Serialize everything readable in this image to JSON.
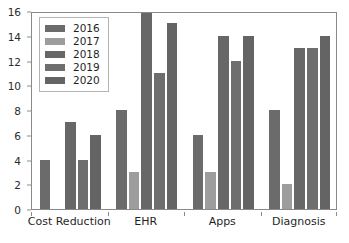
{
  "chart_data": {
    "type": "bar",
    "title": "",
    "subtitle": "",
    "xlabel": "",
    "ylabel": "",
    "categories": [
      "Cost Reduction",
      "EHR",
      "Apps",
      "Diagnosis"
    ],
    "series": [
      {
        "name": "2016",
        "color": "#6b6b6b",
        "values": [
          4,
          8,
          6,
          8
        ]
      },
      {
        "name": "2017",
        "color": "#9d9d9d",
        "values": [
          0,
          3,
          3,
          2
        ]
      },
      {
        "name": "2018",
        "color": "#676767",
        "values": [
          7,
          16,
          14,
          13
        ]
      },
      {
        "name": "2019",
        "color": "#6e6e6e",
        "values": [
          4,
          11,
          12,
          13
        ]
      },
      {
        "name": "2020",
        "color": "#646464",
        "values": [
          6,
          15,
          14,
          14
        ]
      }
    ],
    "ylim": [
      0,
      16
    ],
    "yticks": [
      0,
      2,
      4,
      6,
      8,
      10,
      12,
      14,
      16
    ],
    "ytick_labels": [
      "0",
      "2",
      "4",
      "6",
      "8",
      "10",
      "12",
      "14",
      "16"
    ],
    "grid": false,
    "legend_position": "upper left",
    "legend_entries": [
      "2016",
      "2017",
      "2018",
      "2019",
      "2020"
    ],
    "axis_color": "#8a8a8a",
    "background_color": "#ffffff"
  }
}
